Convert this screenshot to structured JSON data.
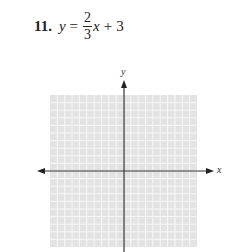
{
  "problem": {
    "number": "11.",
    "lhs": "y",
    "equals": "=",
    "numerator": "2",
    "denominator": "3",
    "x_var": "x",
    "plus": "+",
    "constant": "3"
  },
  "graph": {
    "x_label": "x",
    "y_label": "y",
    "grid_cells_x": 20,
    "grid_cells_y": 20,
    "grid_fill": "#e3e3e3",
    "grid_line_color": "#f7f7f7",
    "axis_color": "#333333"
  },
  "chart_data": {
    "type": "line",
    "xlabel": "x",
    "ylabel": "y",
    "xlim": [
      -10,
      10
    ],
    "ylim": [
      -10,
      10
    ],
    "grid": true,
    "series": [],
    "annotations": [
      "Blank coordinate grid for graphing y = (2/3)x + 3"
    ]
  }
}
